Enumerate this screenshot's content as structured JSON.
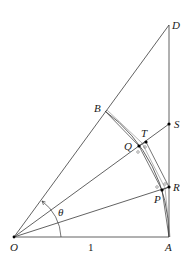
{
  "diagram": {
    "title": "",
    "points": {
      "O": {
        "label": "O",
        "x": 14,
        "y": 237
      },
      "A": {
        "label": "A",
        "x": 169,
        "y": 237
      },
      "D": {
        "label": "D",
        "x": 169,
        "y": 25
      },
      "B": {
        "label": "B",
        "x": 105,
        "y": 111
      },
      "S": {
        "label": "S",
        "x": 169,
        "y": 124
      },
      "R": {
        "label": "R",
        "x": 169,
        "y": 187
      },
      "P": {
        "label": "P",
        "x": 162,
        "y": 190
      },
      "Q": {
        "label": "Q",
        "x": 139,
        "y": 146
      },
      "T": {
        "label": "T",
        "x": 146,
        "y": 142
      }
    },
    "angle_label": "θ",
    "segment_label_OA": "1",
    "colors": {
      "line": "#3a3a3a",
      "point": "#000000",
      "background": "#ffffff"
    }
  }
}
